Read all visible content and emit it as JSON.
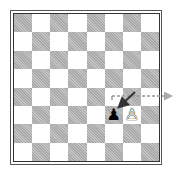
{
  "diagram": {
    "type": "chess-board",
    "orientation": "white-bottom",
    "colors": {
      "light_square": "#ffffff",
      "dark_square": "#b4b4b4",
      "border": "#333333",
      "arrow": "#333333",
      "dashed_arrow": "#999999"
    },
    "pieces": [
      {
        "square": "f3",
        "color": "black",
        "type": "pawn",
        "glyph": "♟"
      },
      {
        "square": "g3",
        "color": "white",
        "type": "pawn",
        "glyph": "♙"
      }
    ],
    "arrows": [
      {
        "from": "g4",
        "to": "f3",
        "style": "solid"
      },
      {
        "from": "f4",
        "to": "off-board-right",
        "style": "dashed"
      }
    ]
  }
}
